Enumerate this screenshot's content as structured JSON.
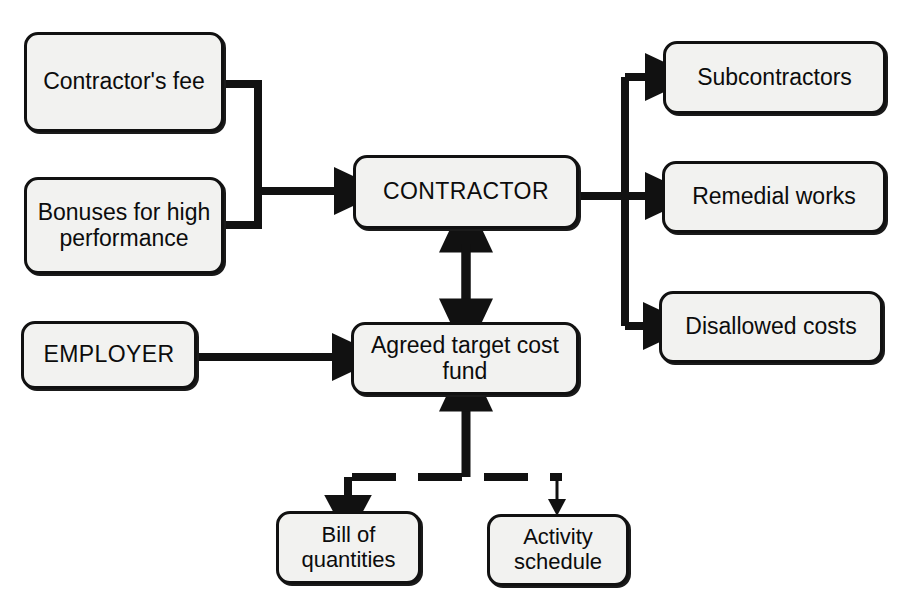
{
  "diagram": {
    "style": {
      "node_fill": "#f2f2f0",
      "node_stroke": "#111111",
      "edge_color": "#111111",
      "background": "#ffffff"
    },
    "nodes": [
      {
        "id": "contractors-fee",
        "label": "Contractor's fee"
      },
      {
        "id": "bonuses",
        "label": "Bonuses for high\nperformance"
      },
      {
        "id": "employer",
        "label": "EMPLOYER"
      },
      {
        "id": "contractor",
        "label": "CONTRACTOR"
      },
      {
        "id": "fund",
        "label": "Agreed target cost\nfund"
      },
      {
        "id": "subcontractors",
        "label": "Subcontractors"
      },
      {
        "id": "remedial-works",
        "label": "Remedial works"
      },
      {
        "id": "disallowed-costs",
        "label": "Disallowed costs"
      },
      {
        "id": "bill-of-quantities",
        "label": "Bill of\nquantities"
      },
      {
        "id": "activity-schedule",
        "label": "Activity\nschedule"
      }
    ],
    "edges": [
      {
        "from": "contractors-fee",
        "to": "contractor",
        "style": "solid",
        "arrows": "single"
      },
      {
        "from": "bonuses",
        "to": "contractor",
        "style": "solid",
        "arrows": "single"
      },
      {
        "from": "employer",
        "to": "fund",
        "style": "solid",
        "arrows": "single"
      },
      {
        "from": "contractor",
        "to": "fund",
        "style": "solid",
        "arrows": "double"
      },
      {
        "from": "contractor",
        "to": "subcontractors",
        "style": "solid",
        "arrows": "single"
      },
      {
        "from": "contractor",
        "to": "remedial-works",
        "style": "solid",
        "arrows": "single"
      },
      {
        "from": "contractor",
        "to": "disallowed-costs",
        "style": "solid",
        "arrows": "single"
      },
      {
        "from": "bill-of-quantities",
        "to": "fund",
        "style": "dashed",
        "arrows": "single"
      },
      {
        "from": "activity-schedule",
        "to": "fund",
        "style": "dashed",
        "arrows": "single"
      }
    ]
  }
}
